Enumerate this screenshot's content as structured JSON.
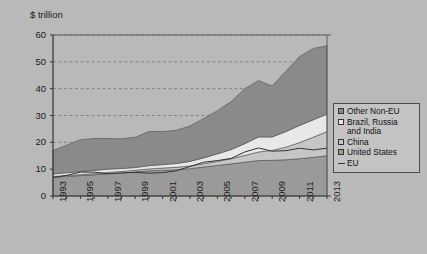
{
  "axis_title": "$ trillion",
  "legend": {
    "items": [
      {
        "label": "Other Non-EU",
        "marker": "swatch",
        "color": "#8a8a8a"
      },
      {
        "label": "Brazil, Russia\nand India",
        "marker": "swatch",
        "color": "#e8e8e8"
      },
      {
        "label": "China",
        "marker": "swatch",
        "color": "#c6c6c6"
      },
      {
        "label": "United States",
        "marker": "swatch",
        "color": "#9a9a9a"
      },
      {
        "label": "EU",
        "marker": "line",
        "color": "#333333"
      }
    ]
  },
  "chart_data": {
    "type": "area",
    "title": "",
    "subtitle": "",
    "xlabel": "",
    "ylabel": "$ trillion",
    "ylim": [
      0,
      60
    ],
    "xlim": [
      1993,
      2013
    ],
    "yticks": [
      0,
      10,
      20,
      30,
      40,
      50,
      60
    ],
    "xticks": [
      1993,
      1995,
      1997,
      1999,
      2001,
      2003,
      2005,
      2007,
      2009,
      2011,
      2013
    ],
    "xtick_labels": [
      "1993",
      "1995",
      "1997",
      "1999",
      "2001",
      "2003",
      "2005",
      "2007",
      "2009",
      "2011",
      "2013"
    ],
    "ytick_labels": [
      "0",
      "10",
      "20",
      "30",
      "40",
      "50",
      "60"
    ],
    "grid": "horizontal-dashed",
    "legend_position": "right-outside",
    "stacked": true,
    "x": [
      1993,
      1994,
      1995,
      1996,
      1997,
      1998,
      1999,
      2000,
      2001,
      2002,
      2003,
      2004,
      2005,
      2006,
      2007,
      2008,
      2009,
      2010,
      2011,
      2012,
      2013
    ],
    "series": [
      {
        "name": "United States",
        "color": "#9a9a9a",
        "values": [
          7.0,
          7.3,
          7.6,
          7.9,
          8.3,
          8.6,
          9.0,
          9.4,
          9.6,
          9.8,
          10.2,
          10.8,
          11.4,
          12.0,
          12.6,
          13.2,
          13.3,
          13.5,
          13.9,
          14.4,
          15.0
        ]
      },
      {
        "name": "China",
        "color": "#c6c6c6",
        "values": [
          0.3,
          0.35,
          0.4,
          0.45,
          0.5,
          0.55,
          0.6,
          0.7,
          0.8,
          0.9,
          1.0,
          1.2,
          1.5,
          1.9,
          2.5,
          3.2,
          3.7,
          4.7,
          6.0,
          7.5,
          9.0
        ]
      },
      {
        "name": "Brazil, Russia and India",
        "color": "#e8e8e8",
        "values": [
          0.9,
          1.0,
          1.1,
          1.2,
          1.2,
          1.1,
          1.0,
          1.2,
          1.3,
          1.4,
          1.7,
          2.2,
          2.8,
          3.4,
          4.4,
          5.6,
          5.0,
          5.8,
          6.4,
          6.5,
          6.5
        ]
      },
      {
        "name": "Other Non-EU",
        "color": "#8a8a8a",
        "values": [
          8.8,
          10.3,
          11.9,
          11.9,
          11.4,
          11.1,
          11.3,
          12.7,
          12.3,
          12.4,
          13.2,
          14.7,
          16.1,
          17.9,
          20.5,
          21.0,
          19.0,
          22.5,
          25.7,
          26.6,
          25.5
        ]
      }
    ],
    "overlay_lines": [
      {
        "name": "EU",
        "color": "#333333",
        "values": [
          6.9,
          7.7,
          8.9,
          8.9,
          8.3,
          8.6,
          8.8,
          8.5,
          8.7,
          9.4,
          11.0,
          12.6,
          13.2,
          14.0,
          16.4,
          17.9,
          16.7,
          16.9,
          17.8,
          17.2,
          17.8
        ]
      }
    ],
    "totals": [
      17.0,
      19.0,
      21.0,
      21.5,
      21.4,
      21.4,
      21.9,
      24.0,
      24.0,
      24.5,
      26.1,
      28.9,
      31.8,
      35.2,
      40.0,
      43.0,
      41.0,
      46.5,
      52.0,
      55.0,
      56.0
    ]
  }
}
